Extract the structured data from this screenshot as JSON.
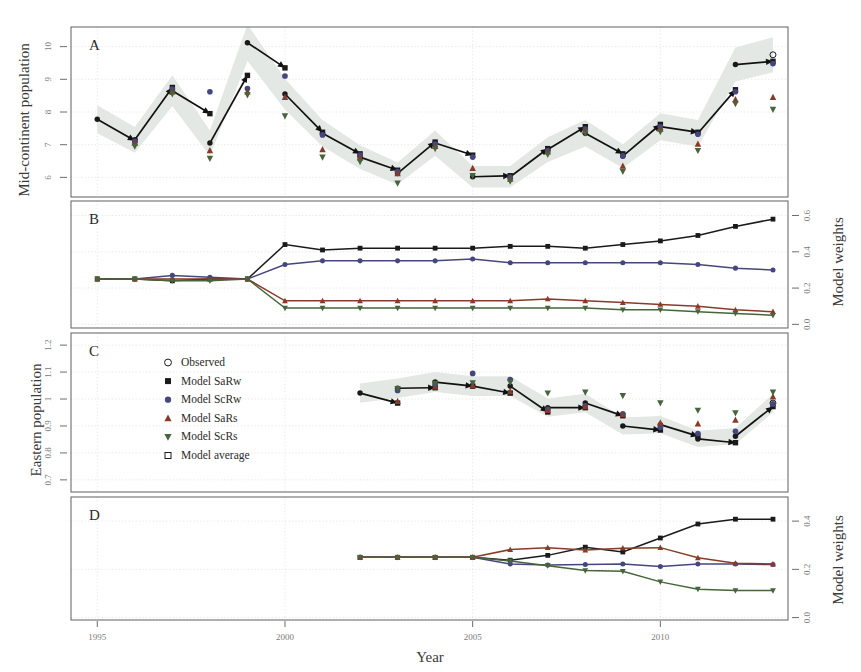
{
  "figure": {
    "xlabel": "Year",
    "x_ticks": [
      1995,
      2000,
      2005,
      2010
    ],
    "x_range": [
      1994.3,
      2013.4
    ]
  },
  "legend": {
    "position": "panel-C-upper-left",
    "entries": [
      {
        "label": "Observed",
        "marker": "open-circle",
        "color": "#1a1a1a"
      },
      {
        "label": "Model SaRw",
        "marker": "filled-square",
        "color": "#1a1a1a"
      },
      {
        "label": "Model ScRw",
        "marker": "filled-circle",
        "color": "#46467f"
      },
      {
        "label": "Model SaRs",
        "marker": "triangle-up",
        "color": "#8a3a28"
      },
      {
        "label": "Model ScRs",
        "marker": "triangle-down",
        "color": "#46653a"
      },
      {
        "label": "Model average",
        "marker": "open-square",
        "color": "#1a1a1a"
      }
    ]
  },
  "chart_data": [
    {
      "panel": "A",
      "type": "scatter",
      "title": "A",
      "ylabel": "Mid-continent population",
      "xlabel": "Year",
      "ylim": [
        5.4,
        10.6
      ],
      "y_ticks": [
        6,
        7,
        8,
        9,
        10
      ],
      "xlim": [
        1994.3,
        2013.4
      ],
      "grid": true,
      "band_label": "observed 95% interval",
      "observed": {
        "name": "Observed",
        "x": [
          1995,
          1996,
          1997,
          1998,
          1999,
          2000,
          2001,
          2002,
          2003,
          2004,
          2005,
          2006,
          2007,
          2008,
          2009,
          2010,
          2011,
          2012,
          2013
        ],
        "y": [
          7.78,
          7.15,
          8.65,
          7.05,
          10.12,
          8.55,
          7.35,
          6.62,
          6.12,
          7.05,
          6.02,
          6.02,
          6.85,
          7.35,
          6.65,
          7.55,
          7.35,
          9.45,
          9.75
        ]
      },
      "predictions": [
        {
          "name": "Model SaRw",
          "marker": "filled-square",
          "color": "#1a1a1a",
          "x": [
            1996,
            1997,
            1998,
            1999,
            2000,
            2001,
            2002,
            2003,
            2004,
            2005,
            2006,
            2007,
            2008,
            2009,
            2010,
            2011,
            2012,
            2013
          ],
          "y": [
            7.12,
            8.75,
            7.95,
            9.12,
            9.35,
            7.38,
            6.72,
            6.22,
            7.08,
            6.68,
            6.05,
            6.88,
            7.55,
            6.72,
            7.62,
            7.38,
            8.68,
            9.55
          ]
        },
        {
          "name": "Model ScRw",
          "marker": "filled-circle",
          "color": "#46467f",
          "x": [
            1996,
            1997,
            1998,
            1999,
            2000,
            2001,
            2002,
            2003,
            2004,
            2005,
            2006,
            2007,
            2008,
            2009,
            2010,
            2011,
            2012,
            2013
          ],
          "y": [
            7.1,
            8.7,
            8.62,
            8.72,
            9.1,
            7.3,
            6.68,
            6.18,
            7.02,
            6.62,
            6.0,
            6.82,
            7.48,
            6.66,
            7.55,
            7.32,
            8.62,
            9.48
          ]
        },
        {
          "name": "Model SaRs",
          "marker": "triangle-up",
          "color": "#8a3a28",
          "x": [
            1996,
            1997,
            1998,
            1999,
            2000,
            2001,
            2002,
            2003,
            2004,
            2005,
            2006,
            2007,
            2008,
            2009,
            2010,
            2011,
            2012,
            2013
          ],
          "y": [
            7.05,
            8.62,
            6.82,
            8.62,
            8.45,
            6.85,
            6.6,
            6.12,
            6.95,
            6.28,
            5.95,
            6.78,
            7.42,
            6.35,
            7.48,
            7.02,
            8.38,
            8.45
          ]
        },
        {
          "name": "Model ScRs",
          "marker": "triangle-down",
          "color": "#46653a",
          "x": [
            1996,
            1997,
            1998,
            1999,
            2000,
            2001,
            2002,
            2003,
            2004,
            2005,
            2006,
            2007,
            2008,
            2009,
            2010,
            2011,
            2012,
            2013
          ],
          "y": [
            6.95,
            8.55,
            6.58,
            8.52,
            7.88,
            6.62,
            6.48,
            5.82,
            6.88,
            6.05,
            5.88,
            6.7,
            7.35,
            6.18,
            7.4,
            6.82,
            8.25,
            8.08
          ]
        }
      ]
    },
    {
      "panel": "B",
      "type": "line",
      "title": "B",
      "ylabel": "Model weights",
      "ylim": [
        -0.02,
        0.68
      ],
      "y_ticks": [
        0.0,
        0.2,
        0.4,
        0.6
      ],
      "xlim": [
        1994.3,
        2013.4
      ],
      "grid": true,
      "x": [
        1995,
        1996,
        1997,
        1998,
        1999,
        2000,
        2001,
        2002,
        2003,
        2004,
        2005,
        2006,
        2007,
        2008,
        2009,
        2010,
        2011,
        2012,
        2013
      ],
      "series": [
        {
          "name": "Model SaRw",
          "color": "#1a1a1a",
          "marker": "filled-square",
          "values": [
            0.25,
            0.25,
            0.24,
            0.25,
            0.25,
            0.44,
            0.41,
            0.42,
            0.42,
            0.42,
            0.42,
            0.43,
            0.43,
            0.42,
            0.44,
            0.46,
            0.49,
            0.54,
            0.58
          ]
        },
        {
          "name": "Model ScRw",
          "color": "#46467f",
          "marker": "filled-circle",
          "values": [
            0.25,
            0.25,
            0.27,
            0.26,
            0.25,
            0.33,
            0.35,
            0.35,
            0.35,
            0.35,
            0.36,
            0.34,
            0.34,
            0.34,
            0.34,
            0.34,
            0.33,
            0.31,
            0.3
          ]
        },
        {
          "name": "Model SaRs",
          "color": "#8a3a28",
          "marker": "triangle-up",
          "values": [
            0.25,
            0.25,
            0.25,
            0.25,
            0.25,
            0.13,
            0.13,
            0.13,
            0.13,
            0.13,
            0.13,
            0.13,
            0.14,
            0.13,
            0.12,
            0.11,
            0.1,
            0.08,
            0.07
          ]
        },
        {
          "name": "Model ScRs",
          "color": "#46653a",
          "marker": "triangle-down",
          "values": [
            0.25,
            0.25,
            0.24,
            0.24,
            0.25,
            0.09,
            0.09,
            0.09,
            0.09,
            0.09,
            0.09,
            0.09,
            0.09,
            0.09,
            0.08,
            0.08,
            0.07,
            0.06,
            0.05
          ]
        }
      ]
    },
    {
      "panel": "C",
      "type": "scatter",
      "title": "C",
      "ylabel": "Eastern population",
      "ylim": [
        0.655,
        1.245
      ],
      "y_ticks": [
        0.7,
        0.8,
        0.9,
        1.0,
        1.1,
        1.2
      ],
      "xlim": [
        1994.3,
        2013.4
      ],
      "grid": true,
      "observed": {
        "name": "Observed",
        "x": [
          2002,
          2003,
          2004,
          2005,
          2006,
          2007,
          2008,
          2009,
          2010,
          2011,
          2012,
          2013
        ],
        "y": [
          1.022,
          1.04,
          1.063,
          1.048,
          1.048,
          0.968,
          0.985,
          0.9,
          0.905,
          0.852,
          0.862,
          0.985
        ]
      },
      "predictions": [
        {
          "name": "Model SaRw",
          "marker": "filled-square",
          "color": "#1a1a1a",
          "x": [
            2003,
            2004,
            2005,
            2006,
            2007,
            2008,
            2009,
            2010,
            2011,
            2012,
            2013
          ],
          "y": [
            0.985,
            1.042,
            1.048,
            1.022,
            0.952,
            0.968,
            0.938,
            0.885,
            0.862,
            0.838,
            0.972
          ]
        },
        {
          "name": "Model ScRw",
          "marker": "filled-circle",
          "color": "#46467f",
          "x": [
            2003,
            2004,
            2005,
            2006,
            2007,
            2008,
            2009,
            2010,
            2011,
            2012,
            2013
          ],
          "y": [
            1.032,
            1.055,
            1.095,
            1.072,
            0.962,
            0.975,
            0.945,
            0.895,
            0.872,
            0.88,
            0.982
          ]
        },
        {
          "name": "Model SaRs",
          "marker": "triangle-up",
          "color": "#8a3a28",
          "x": [
            2003,
            2004,
            2005,
            2006,
            2007,
            2008,
            2009,
            2010,
            2011,
            2012,
            2013
          ],
          "y": [
            0.992,
            1.045,
            1.05,
            1.028,
            0.958,
            0.972,
            0.942,
            0.912,
            0.908,
            0.922,
            1.008
          ]
        },
        {
          "name": "Model ScRs",
          "marker": "triangle-down",
          "color": "#46653a",
          "x": [
            2003,
            2004,
            2005,
            2006,
            2007,
            2008,
            2009,
            2010,
            2011,
            2012,
            2013
          ],
          "y": [
            1.038,
            1.058,
            1.06,
            1.062,
            1.022,
            1.025,
            1.012,
            0.985,
            0.958,
            0.948,
            1.025
          ]
        }
      ]
    },
    {
      "panel": "D",
      "type": "line",
      "title": "D",
      "ylabel": "Model weights",
      "ylim": [
        -0.01,
        0.5
      ],
      "y_ticks": [
        0.0,
        0.2,
        0.4
      ],
      "xlim": [
        1994.3,
        2013.4
      ],
      "grid": true,
      "x": [
        2002,
        2003,
        2004,
        2005,
        2006,
        2007,
        2008,
        2009,
        2010,
        2011,
        2012,
        2013
      ],
      "series": [
        {
          "name": "Model SaRw",
          "color": "#1a1a1a",
          "marker": "filled-square",
          "values": [
            0.25,
            0.25,
            0.25,
            0.25,
            0.238,
            0.258,
            0.292,
            0.272,
            0.33,
            0.388,
            0.408,
            0.408
          ]
        },
        {
          "name": "Model ScRw",
          "color": "#46467f",
          "marker": "filled-circle",
          "values": [
            0.25,
            0.25,
            0.25,
            0.25,
            0.222,
            0.218,
            0.22,
            0.222,
            0.212,
            0.222,
            0.222,
            0.22
          ]
        },
        {
          "name": "Model SaRs",
          "color": "#8a3a28",
          "marker": "triangle-up",
          "values": [
            0.25,
            0.25,
            0.25,
            0.25,
            0.282,
            0.29,
            0.28,
            0.288,
            0.29,
            0.248,
            0.225,
            0.222
          ]
        },
        {
          "name": "Model ScRs",
          "color": "#46653a",
          "marker": "triangle-down",
          "values": [
            0.25,
            0.25,
            0.25,
            0.25,
            0.235,
            0.215,
            0.195,
            0.192,
            0.148,
            0.118,
            0.112,
            0.112
          ]
        }
      ]
    }
  ]
}
